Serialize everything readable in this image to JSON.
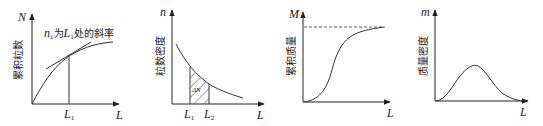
{
  "panels": [
    {
      "id": "cumulative-count",
      "y_axis_symbol": "N",
      "y_axis_label": "累积粒数",
      "x_axis_symbol": "L",
      "annotation": {
        "n": "n",
        "n_sub": "1",
        "mid": "为",
        "L": "L",
        "L_sub": "1",
        "tail": "处的斜率"
      },
      "markers": [
        {
          "symbol": "L",
          "sub": "1"
        }
      ]
    },
    {
      "id": "count-density",
      "y_axis_symbol": "n",
      "y_axis_label": "粒数密度",
      "x_axis_symbol": "L",
      "area_label": "ΔN",
      "markers": [
        {
          "symbol": "L",
          "sub": "1"
        },
        {
          "symbol": "L",
          "sub": "2"
        }
      ]
    },
    {
      "id": "cumulative-mass",
      "y_axis_symbol": "M",
      "y_axis_label": "累积质量",
      "x_axis_symbol": "L"
    },
    {
      "id": "mass-density",
      "y_axis_symbol": "m",
      "y_axis_label": "质量密度",
      "x_axis_symbol": "L"
    }
  ]
}
